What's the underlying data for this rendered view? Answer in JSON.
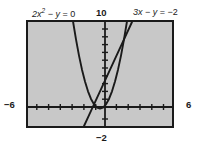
{
  "figure": {
    "kind": "coordinate-graph",
    "background_color": "#ffffff",
    "plot_background_color": "#c8c8c8",
    "frame_color": "#1a1a1a",
    "curve_color": "#1a1a1a",
    "labels": {
      "equation_left": {
        "coef": "2",
        "var": "x",
        "exponent": "2",
        "minus_y": "− y",
        "equals": "= 0",
        "full": "2x² − y = 0"
      },
      "equation_right": {
        "coef": "3",
        "var": "x",
        "minus_y": "− y",
        "equals": "= −2",
        "full": "3x − y = −2"
      },
      "axis_top": "10",
      "axis_bottom": "−2",
      "axis_left": "−6",
      "axis_right": "6"
    }
  },
  "chart_data": {
    "type": "line",
    "title": "",
    "xlabel": "",
    "ylabel": "",
    "xlim": [
      -6,
      6
    ],
    "ylim": [
      -2,
      10
    ],
    "grid": false,
    "legend": "none",
    "x_tick_labels": [
      "−6",
      "6"
    ],
    "y_tick_labels": [
      "10",
      "−2"
    ],
    "x_tick_count": 12,
    "y_tick_count": 12,
    "annotations": [
      {
        "text": "2x² − y = 0",
        "position": "top-left",
        "target_series": "parabola"
      },
      {
        "text": "3x − y = −2",
        "position": "top-right",
        "target_series": "line"
      }
    ],
    "series": [
      {
        "name": "parabola",
        "equation": "2x^2 - y = 0",
        "explicit": "y = 2x^2",
        "style": "solid",
        "color": "#1a1a1a",
        "x": [
          -2.24,
          -2.0,
          -1.75,
          -1.5,
          -1.25,
          -1.0,
          -0.75,
          -0.5,
          -0.25,
          0,
          0.25,
          0.5,
          0.75,
          1.0,
          1.25,
          1.5,
          1.75,
          2.0,
          2.24
        ],
        "y": [
          10.0,
          8.0,
          6.125,
          4.5,
          3.125,
          2.0,
          1.125,
          0.5,
          0.125,
          0,
          0.125,
          0.5,
          1.125,
          2.0,
          3.125,
          4.5,
          6.125,
          8.0,
          10.0
        ]
      },
      {
        "name": "line",
        "equation": "3x - y = -2",
        "explicit": "y = 3x + 2",
        "style": "solid",
        "color": "#1a1a1a",
        "x": [
          -1.333,
          -1.0,
          0,
          1.0,
          2.0,
          2.667
        ],
        "y": [
          -2.0,
          -1.0,
          2.0,
          5.0,
          8.0,
          10.0
        ]
      }
    ],
    "intersections": [
      {
        "x": 0.5,
        "y": 0.5
      },
      {
        "x": 2.0,
        "y": 8.0
      }
    ]
  }
}
